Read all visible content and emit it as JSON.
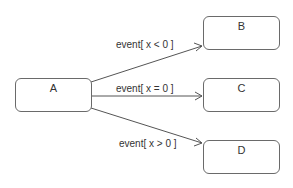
{
  "diagram": {
    "type": "state-machine",
    "states": [
      {
        "id": "A",
        "name": "A"
      },
      {
        "id": "B",
        "name": "B"
      },
      {
        "id": "C",
        "name": "C"
      },
      {
        "id": "D",
        "name": "D"
      }
    ],
    "transitions": [
      {
        "from": "A",
        "to": "B",
        "label": "event[ x < 0 ]"
      },
      {
        "from": "A",
        "to": "C",
        "label": "event[ x = 0 ]"
      },
      {
        "from": "A",
        "to": "D",
        "label": "event[ x > 0 ]"
      }
    ],
    "colors": {
      "line": "#555555",
      "border": "#6a6a6a",
      "background": "#ffffff"
    }
  }
}
